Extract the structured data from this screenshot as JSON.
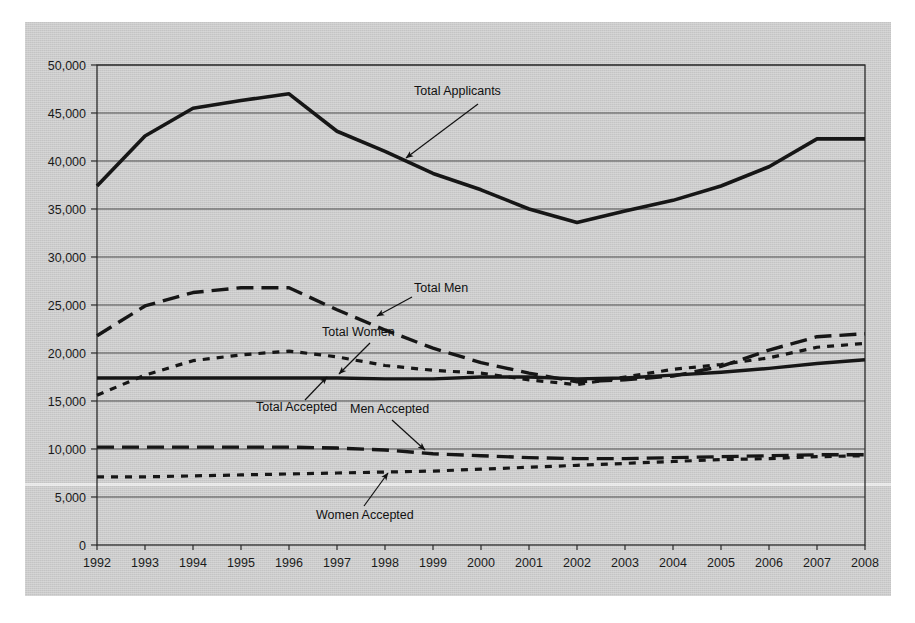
{
  "chart_data": {
    "type": "line",
    "title": "",
    "xlabel": "",
    "ylabel": "",
    "x": [
      1992,
      1993,
      1994,
      1995,
      1996,
      1997,
      1998,
      1999,
      2000,
      2001,
      2002,
      2003,
      2004,
      2005,
      2006,
      2007,
      2008
    ],
    "categories": [
      "1992",
      "1993",
      "1994",
      "1995",
      "1996",
      "1997",
      "1998",
      "1999",
      "2000",
      "2001",
      "2002",
      "2003",
      "2004",
      "2005",
      "2006",
      "2007",
      "2008"
    ],
    "ylim": [
      0,
      50000
    ],
    "xlim": [
      1992,
      2008
    ],
    "y_ticks": [
      0,
      5000,
      10000,
      15000,
      20000,
      25000,
      30000,
      35000,
      40000,
      45000,
      50000
    ],
    "y_tick_labels": [
      "0",
      "5,000",
      "10,000",
      "15,000",
      "20,000",
      "25,000",
      "30,000",
      "35,000",
      "40,000",
      "45,000",
      "50,000"
    ],
    "grid": "horizontal",
    "legend": "none (inline annotations with leader arrows)",
    "series": [
      {
        "name": "Total Applicants",
        "style": "solid",
        "values": [
          37400,
          42600,
          45500,
          46300,
          47000,
          43100,
          41000,
          38700,
          37000,
          35000,
          33600,
          34800,
          35900,
          37400,
          39400,
          42300,
          42300
        ]
      },
      {
        "name": "Total Men",
        "style": "dashed",
        "values": [
          21800,
          24900,
          26300,
          26800,
          26800,
          24500,
          22400,
          20500,
          19000,
          17900,
          17000,
          17200,
          17600,
          18600,
          20300,
          21700,
          22000
        ]
      },
      {
        "name": "Total Women",
        "style": "dotted",
        "values": [
          15600,
          17700,
          19200,
          19800,
          20200,
          19600,
          18700,
          18200,
          17900,
          17200,
          16700,
          17500,
          18300,
          18800,
          19500,
          20600,
          21000
        ]
      },
      {
        "name": "Total Accepted",
        "style": "solid",
        "values": [
          17400,
          17400,
          17400,
          17400,
          17400,
          17400,
          17300,
          17300,
          17500,
          17500,
          17300,
          17400,
          17700,
          18000,
          18400,
          18900,
          19300
        ]
      },
      {
        "name": "Men Accepted",
        "style": "dashed",
        "values": [
          10200,
          10200,
          10200,
          10200,
          10200,
          10100,
          9900,
          9500,
          9300,
          9100,
          9000,
          9000,
          9100,
          9200,
          9300,
          9400,
          9400
        ]
      },
      {
        "name": "Women Accepted",
        "style": "dotted",
        "values": [
          7100,
          7100,
          7200,
          7300,
          7400,
          7500,
          7600,
          7700,
          7900,
          8100,
          8300,
          8500,
          8700,
          8900,
          9000,
          9200,
          9300
        ]
      }
    ],
    "annotations": [
      {
        "text": "Total Applicants",
        "label_x": 414,
        "label_y": 95,
        "arrow_from_x": 478,
        "arrow_from_y": 104,
        "arrow_to_x": 406,
        "arrow_to_y": 158
      },
      {
        "text": "Total Men",
        "label_x": 414,
        "label_y": 292,
        "arrow_from_x": 412,
        "arrow_from_y": 297,
        "arrow_to_x": 377,
        "arrow_to_y": 316
      },
      {
        "text": "Total Women",
        "label_x": 322,
        "label_y": 336,
        "arrow_from_x": 370,
        "arrow_from_y": 343,
        "arrow_to_x": 339,
        "arrow_to_y": 374
      },
      {
        "text": "Total Accepted",
        "label_x": 256,
        "label_y": 411,
        "arrow_from_x": 305,
        "arrow_from_y": 400,
        "arrow_to_x": 327,
        "arrow_to_y": 377
      },
      {
        "text": "Men Accepted",
        "label_x": 350,
        "label_y": 413,
        "arrow_from_x": 392,
        "arrow_from_y": 420,
        "arrow_to_x": 425,
        "arrow_to_y": 450
      },
      {
        "text": "Women Accepted",
        "label_x": 316,
        "label_y": 519,
        "arrow_from_x": 364,
        "arrow_from_y": 506,
        "arrow_to_x": 388,
        "arrow_to_y": 473
      }
    ]
  },
  "colors": {
    "page_background": "#ffffff",
    "chart_background": "#cbcbcb",
    "line": "#161616",
    "gridline": "#4a4a4a",
    "axis": "#2b2b2b",
    "text": "#111111"
  }
}
